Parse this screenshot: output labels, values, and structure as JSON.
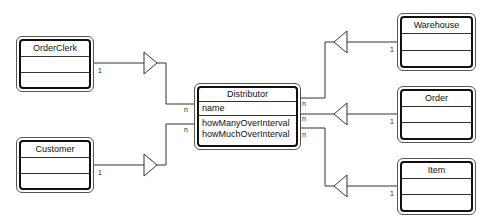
{
  "diagram": {
    "type": "UML class diagram",
    "classes": {
      "order_clerk": {
        "name": "OrderClerk",
        "attributes": [],
        "operations": []
      },
      "customer": {
        "name": "Customer",
        "attributes": [],
        "operations": []
      },
      "distributor": {
        "name": "Distributor",
        "attributes": [
          "name"
        ],
        "operations": [
          "howManyOverInterval",
          "howMuchOverInterval"
        ]
      },
      "warehouse": {
        "name": "Warehouse",
        "attributes": [],
        "operations": []
      },
      "order": {
        "name": "Order",
        "attributes": [],
        "operations": []
      },
      "item": {
        "name": "Item",
        "attributes": [],
        "operations": []
      }
    },
    "associations": [
      {
        "from": "OrderClerk",
        "to": "Distributor",
        "from_mult": "1",
        "to_mult": "n"
      },
      {
        "from": "Customer",
        "to": "Distributor",
        "from_mult": "1",
        "to_mult": "n"
      },
      {
        "from": "Warehouse",
        "to": "Distributor",
        "from_mult": "1",
        "to_mult": "n"
      },
      {
        "from": "Order",
        "to": "Distributor",
        "from_mult": "1",
        "to_mult": "n"
      },
      {
        "from": "Item",
        "to": "Distributor",
        "from_mult": "1",
        "to_mult": "n"
      }
    ],
    "multiplicities": {
      "one": "1",
      "many": "n"
    }
  }
}
